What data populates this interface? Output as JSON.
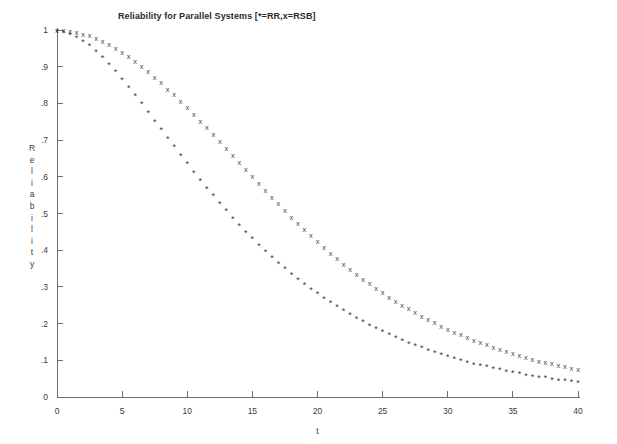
{
  "chart_data": {
    "type": "scatter",
    "title": "Reliability for Parallel Systems [*=RR,x=RSB]",
    "xlabel": "t",
    "ylabel": "Reliability",
    "ylabel_letters": [
      "R",
      "e",
      "l",
      "i",
      "a",
      "b",
      "i",
      "l",
      "i",
      "t",
      "y"
    ],
    "xlim": [
      0,
      40
    ],
    "ylim": [
      0,
      1
    ],
    "xticks": [
      0,
      5,
      10,
      15,
      20,
      25,
      30,
      35,
      40
    ],
    "xticklabels": [
      "0",
      "5",
      "10",
      "15",
      "20",
      "25",
      "30",
      "35",
      "40"
    ],
    "yticks": [
      0,
      0.1,
      0.2,
      0.3,
      0.4,
      0.5,
      0.6,
      0.7,
      0.8,
      0.9,
      1
    ],
    "yticklabels": [
      "0",
      ".1",
      ".2",
      ".3",
      ".4",
      ".5",
      ".6",
      ".7",
      ".8",
      ".9",
      "1"
    ],
    "grid": false,
    "legend_position": "in-title",
    "marker_colors": {
      "RR": "#3a3a3a",
      "RSB": "#404040"
    },
    "x": [
      0,
      0.5,
      1,
      1.5,
      2,
      2.5,
      3,
      3.5,
      4,
      4.5,
      5,
      5.5,
      6,
      6.5,
      7,
      7.5,
      8,
      8.5,
      9,
      9.5,
      10,
      10.5,
      11,
      11.5,
      12,
      12.5,
      13,
      13.5,
      14,
      14.5,
      15,
      15.5,
      16,
      16.5,
      17,
      17.5,
      18,
      18.5,
      19,
      19.5,
      20,
      20.5,
      21,
      21.5,
      22,
      22.5,
      23,
      23.5,
      24,
      24.5,
      25,
      25.5,
      26,
      26.5,
      27,
      27.5,
      28,
      28.5,
      29,
      29.5,
      30,
      30.5,
      31,
      31.5,
      32,
      32.5,
      33,
      33.5,
      34,
      34.5,
      35,
      35.5,
      36,
      36.5,
      37,
      37.5,
      38,
      38.5,
      39,
      39.5,
      40
    ],
    "series": [
      {
        "name": "RSB",
        "marker": "x",
        "legend_key": "x=RSB",
        "values": [
          1.0,
          0.999,
          0.997,
          0.994,
          0.989,
          0.984,
          0.977,
          0.969,
          0.96,
          0.95,
          0.939,
          0.927,
          0.914,
          0.901,
          0.886,
          0.871,
          0.856,
          0.839,
          0.823,
          0.805,
          0.788,
          0.77,
          0.751,
          0.733,
          0.714,
          0.695,
          0.676,
          0.657,
          0.638,
          0.619,
          0.6,
          0.581,
          0.562,
          0.544,
          0.526,
          0.508,
          0.49,
          0.473,
          0.456,
          0.439,
          0.423,
          0.407,
          0.392,
          0.377,
          0.362,
          0.348,
          0.334,
          0.321,
          0.308,
          0.296,
          0.284,
          0.272,
          0.261,
          0.25,
          0.24,
          0.23,
          0.22,
          0.211,
          0.202,
          0.193,
          0.185,
          0.177,
          0.169,
          0.162,
          0.155,
          0.148,
          0.142,
          0.135,
          0.129,
          0.124,
          0.118,
          0.113,
          0.108,
          0.103,
          0.098,
          0.094,
          0.09,
          0.086,
          0.082,
          0.078,
          0.075
        ]
      },
      {
        "name": "RR",
        "marker": "*",
        "legend_key": "*=RR",
        "values": [
          1.0,
          0.998,
          0.993,
          0.985,
          0.974,
          0.961,
          0.946,
          0.929,
          0.911,
          0.891,
          0.87,
          0.848,
          0.826,
          0.803,
          0.78,
          0.756,
          0.733,
          0.709,
          0.686,
          0.663,
          0.64,
          0.617,
          0.595,
          0.573,
          0.552,
          0.531,
          0.511,
          0.491,
          0.472,
          0.453,
          0.435,
          0.418,
          0.401,
          0.384,
          0.369,
          0.353,
          0.339,
          0.324,
          0.311,
          0.298,
          0.285,
          0.273,
          0.261,
          0.25,
          0.239,
          0.228,
          0.218,
          0.209,
          0.199,
          0.19,
          0.182,
          0.174,
          0.166,
          0.158,
          0.151,
          0.144,
          0.138,
          0.131,
          0.125,
          0.12,
          0.114,
          0.109,
          0.104,
          0.099,
          0.094,
          0.09,
          0.086,
          0.082,
          0.078,
          0.074,
          0.071,
          0.067,
          0.064,
          0.061,
          0.058,
          0.056,
          0.053,
          0.05,
          0.048,
          0.046,
          0.044
        ]
      }
    ]
  }
}
